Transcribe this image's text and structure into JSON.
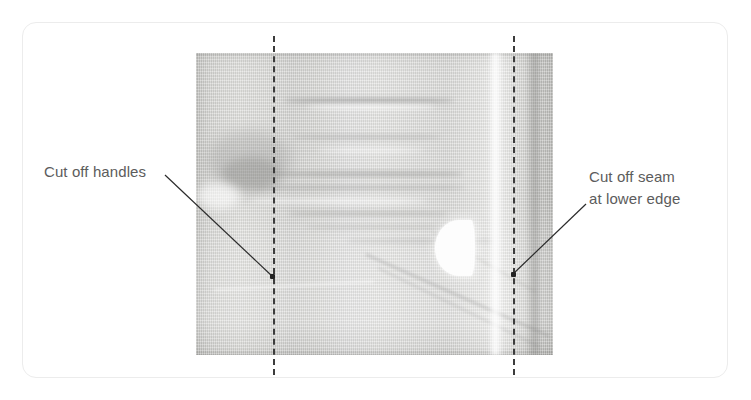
{
  "figure": {
    "type": "instructional-photo-diagram",
    "background_color": "#ffffff",
    "frame": {
      "name": "rounded-content-frame",
      "border_color": "#ececec",
      "corner_radius_px": 14
    },
    "photo": {
      "name": "bag-photo",
      "description": "Flat-laid semi-transparent plastic bag with vertical weave texture, horizontal wrinkles in the upper half, a bright fold and darker seam at the right edge, and a white crescent handle cut-out on the left.",
      "base_color": "#d4d4d1",
      "dark_edge_color": "#b3b3b0",
      "highlight_color": "#efefee"
    },
    "cut_lines": [
      {
        "name": "left-cut-line",
        "style": "dashed",
        "color": "#3c3c3c",
        "orientation": "vertical",
        "position": "through the handle cut-out"
      },
      {
        "name": "right-cut-line",
        "style": "dashed",
        "color": "#3c3c3c",
        "orientation": "vertical",
        "position": "inboard of the side seam"
      }
    ],
    "callouts": [
      {
        "id": "callout-handles",
        "label": "Cut off handles",
        "side": "left",
        "leader_from": [
          165,
          175
        ],
        "leader_to": [
          272,
          276
        ],
        "marker": "dot"
      },
      {
        "id": "callout-seam",
        "label": "Cut off seam\nat lower edge",
        "side": "right",
        "leader_from": [
          586,
          204
        ],
        "leader_to": [
          513,
          274
        ],
        "marker": "dot"
      }
    ],
    "text_color": "#5c5c5c",
    "marker_color": "#222222"
  }
}
